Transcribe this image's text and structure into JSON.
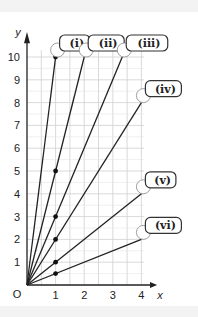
{
  "chart_data": {
    "type": "line",
    "title": "",
    "xlabel": "x",
    "ylabel": "y",
    "origin_label": "O",
    "xlim": [
      0,
      4
    ],
    "ylim": [
      0,
      10
    ],
    "x_ticks": [
      "1",
      "2",
      "3",
      "4"
    ],
    "y_ticks": [
      "1",
      "2",
      "3",
      "4",
      "5",
      "6",
      "7",
      "8",
      "9",
      "10"
    ],
    "grid": true,
    "series": [
      {
        "name": "(i)",
        "slope": 10,
        "points": [
          [
            0,
            0
          ],
          [
            1,
            10
          ]
        ],
        "marked_point": [
          1,
          10
        ]
      },
      {
        "name": "(ii)",
        "slope": 5,
        "points": [
          [
            0,
            0
          ],
          [
            2,
            10
          ]
        ],
        "marked_point": [
          1,
          5
        ]
      },
      {
        "name": "(iii)",
        "slope": 3,
        "points": [
          [
            0,
            0
          ],
          [
            3.33,
            10
          ]
        ],
        "marked_point": [
          1,
          3
        ]
      },
      {
        "name": "(iv)",
        "slope": 2,
        "points": [
          [
            0,
            0
          ],
          [
            4,
            8
          ]
        ],
        "marked_point": [
          1,
          2
        ]
      },
      {
        "name": "(v)",
        "slope": 1,
        "points": [
          [
            0,
            0
          ],
          [
            4,
            4
          ]
        ],
        "marked_point": [
          1,
          1
        ]
      },
      {
        "name": "(vi)",
        "slope": 0.5,
        "points": [
          [
            0,
            0
          ],
          [
            4,
            2
          ]
        ],
        "marked_point": [
          1,
          0.5
        ]
      }
    ]
  }
}
